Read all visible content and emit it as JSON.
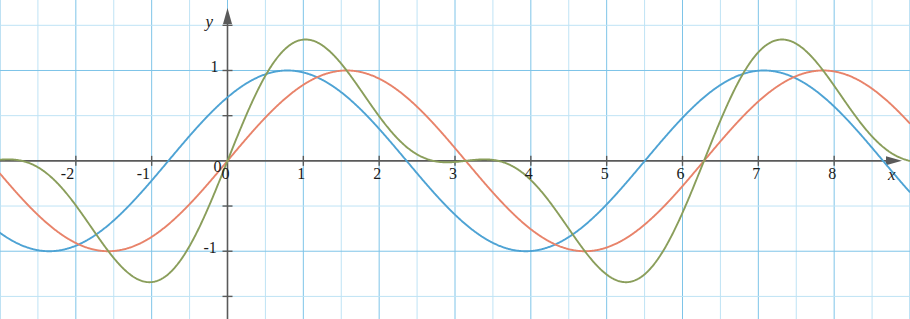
{
  "chart_data": {
    "type": "line",
    "title": "",
    "xlabel": "x",
    "ylabel": "y",
    "xlim": [
      -3.0,
      9.0
    ],
    "ylim": [
      -1.75,
      1.78
    ],
    "grid": true,
    "grid_spacing_x": 0.5,
    "grid_spacing_y": 0.5,
    "axis_style": "arrowed-cartesian",
    "legend": "none",
    "x_tick_labels": [
      "-2",
      "-1",
      "0",
      "1",
      "2",
      "3",
      "4",
      "5",
      "6",
      "7",
      "8"
    ],
    "x_tick_values": [
      -2,
      -1,
      0,
      1,
      2,
      3,
      4,
      5,
      6,
      7,
      8
    ],
    "y_tick_labels": [
      "1",
      "0",
      "-1"
    ],
    "y_tick_values": [
      1,
      0,
      -1
    ],
    "y_minor_ticks": [
      -1.5,
      -0.5,
      0.5,
      1.5
    ],
    "series": [
      {
        "name": "blue-curve",
        "color": "#4ea3d4",
        "amplitude": 1.0,
        "period": 6.283,
        "phase_shift": -0.78,
        "formula": "sin(x + 0.78)",
        "zeros": [
          -2.35,
          -0.78,
          0.79,
          3.14,
          6.28,
          9.0
        ],
        "maxima": [
          {
            "x": -2.35,
            "y": 1.0
          },
          {
            "x": 0.79,
            "y": 1.0
          },
          {
            "x": 4.0,
            "y": 1.0
          },
          {
            "x": 7.13,
            "y": 1.0
          }
        ],
        "minima": [
          {
            "x": -1.1,
            "y": -1.0
          },
          {
            "x": 2.35,
            "y": -1.0
          },
          {
            "x": 5.5,
            "y": -1.0
          },
          {
            "x": 8.4,
            "y": -1.0
          }
        ]
      },
      {
        "name": "red-curve",
        "color": "#e8836a",
        "amplitude": 1.0,
        "period": 6.283,
        "phase_shift": 0.0,
        "formula": "sin(x)",
        "zeros": [
          -3.14,
          0.0,
          3.14,
          6.28
        ],
        "maxima": [
          {
            "x": 1.57,
            "y": 1.0
          },
          {
            "x": 7.85,
            "y": 1.0
          }
        ],
        "minima": [
          {
            "x": -1.57,
            "y": -1.0
          },
          {
            "x": 4.71,
            "y": -1.0
          }
        ]
      },
      {
        "name": "green-curve",
        "color": "#8a9e5b",
        "amplitude_max": 1.55,
        "amplitude_min": 0.55,
        "period": 6.283,
        "formula": "sin(x) + 0.55*sin(2x)",
        "zeros": [
          -3.14,
          0.0,
          1.55,
          3.14,
          4.72,
          6.28
        ],
        "maxima": [
          {
            "x": 1.0,
            "y": 1.52
          },
          {
            "x": -2.5,
            "y": 0.55
          },
          {
            "x": 3.72,
            "y": 0.55
          },
          {
            "x": 7.3,
            "y": 1.52
          }
        ],
        "minima": [
          {
            "x": -1.05,
            "y": -1.5
          },
          {
            "x": 2.6,
            "y": -0.9
          },
          {
            "x": 5.4,
            "y": -1.5
          }
        ]
      }
    ]
  },
  "axes": {
    "x_axis_name": "x-axis",
    "y_axis_name": "y-axis"
  },
  "colors": {
    "grid_minor": "#bfe3f5",
    "grid_major": "#7ec4e8",
    "axis": "#5a5a5a",
    "text": "#1a1a1a",
    "background": "#ffffff"
  }
}
